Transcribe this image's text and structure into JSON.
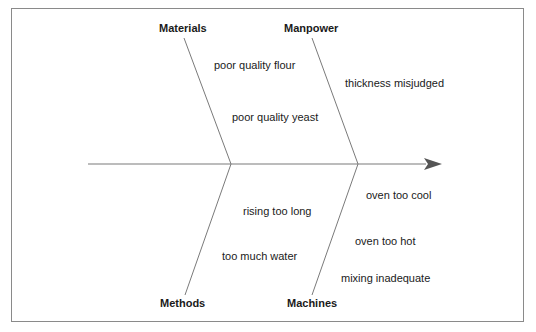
{
  "diagram": {
    "type": "fishbone",
    "categories": {
      "materials": {
        "label": "Materials",
        "causes": [
          "poor quality flour",
          "poor quality yeast"
        ]
      },
      "manpower": {
        "label": "Manpower",
        "causes": [
          "thickness misjudged"
        ]
      },
      "methods": {
        "label": "Methods",
        "causes": [
          "rising too long",
          "too much water"
        ]
      },
      "machines": {
        "label": "Machines",
        "causes": [
          "oven too cool",
          "oven too hot",
          "mixing inadequate"
        ]
      }
    },
    "colors": {
      "line": "#7a7a7a",
      "arrow": "#555555",
      "frame": "#8a8a8a",
      "text": "#1a1a1a"
    }
  }
}
